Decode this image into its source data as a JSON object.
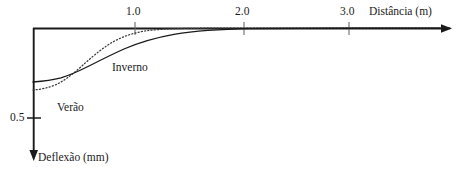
{
  "figure": {
    "name": "deflection-vs-distance-plot",
    "background_color": "#ffffff",
    "ink_color": "#1a1a1a"
  },
  "axes": {
    "x": {
      "title": "Distância (m)",
      "ticks": [
        {
          "label": "1.0",
          "value": 1.0
        },
        {
          "label": "2.0",
          "value": 2.0
        },
        {
          "label": "3.0",
          "value": 3.0
        }
      ],
      "range": [
        0,
        3.9
      ],
      "origin_at_top": true,
      "arrow": true
    },
    "y": {
      "title": "Deflexão (mm)",
      "ticks": [
        {
          "label": "0.5",
          "value": 0.5
        }
      ],
      "range": [
        0,
        1.24
      ],
      "direction": "down",
      "arrow": true
    }
  },
  "series": [
    {
      "name": "Inverno",
      "label": "Inverno",
      "style": "solid",
      "color": "#1a1a1a",
      "path": "M 33,82 C 42,81.2 52,80 61,77.8 C 70,75.2 79,71 89,66 C 100,60.4 112,54.4 124,49 C 139,42.6 156,37.6 174,34.4 C 196,30.8 222,29.2 250,28.7 C 282,28.3 320,28.2 352,28.2 L 450,28.2"
    },
    {
      "name": "Verão",
      "label": "Verão",
      "style": "dotted",
      "color": "#1a1a1a",
      "path": "M 33,90 C 40,89.6 48,88 56,84.6 C 64,81 72,74.6 81,66.8 C 90,58.6 100,50 111,43 C 122,36.6 134,32.6 147,30.6 C 162,28.9 182,28.3 206,28.2 C 244,28.1 300,28.1 352,28.2 L 450,28.2"
    }
  ],
  "annotations": {
    "inverno_label": "Inverno",
    "verao_label": "Verão"
  },
  "chart_data": {
    "type": "line",
    "title": "",
    "xlabel": "Distância (m)",
    "ylabel": "Deflexão (mm)",
    "xlim": [
      0,
      3.9
    ],
    "ylim": [
      0,
      1.24
    ],
    "y_axis_inverted": true,
    "grid": false,
    "legend": "inline-annotations",
    "x_ticks": [
      1.0,
      2.0,
      3.0
    ],
    "x_tick_labels": [
      "1.0",
      "2.0",
      "3.0"
    ],
    "y_ticks": [
      0.5
    ],
    "y_tick_labels": [
      "0.5"
    ],
    "x": [
      0.0,
      0.1,
      0.2,
      0.3,
      0.4,
      0.5,
      0.6,
      0.7,
      0.8,
      0.9,
      1.0,
      1.2,
      1.4,
      1.6,
      1.8,
      2.0,
      2.5,
      3.0,
      3.5
    ],
    "series": [
      {
        "name": "Inverno",
        "style": "solid",
        "values": [
          0.51,
          0.5,
          0.49,
          0.47,
          0.44,
          0.41,
          0.37,
          0.33,
          0.29,
          0.25,
          0.21,
          0.15,
          0.1,
          0.07,
          0.04,
          0.025,
          0.008,
          0.002,
          0.0
        ]
      },
      {
        "name": "Verão",
        "style": "dotted",
        "values": [
          0.59,
          0.585,
          0.575,
          0.555,
          0.52,
          0.465,
          0.4,
          0.335,
          0.27,
          0.21,
          0.155,
          0.085,
          0.045,
          0.022,
          0.01,
          0.004,
          0.001,
          0.0,
          0.0
        ]
      }
    ]
  }
}
